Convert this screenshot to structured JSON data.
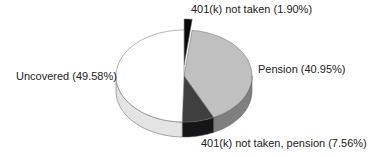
{
  "chart_data": {
    "type": "pie",
    "style": "3d-exploded",
    "title": "",
    "start_angle": -90,
    "direction": "clockwise",
    "slices": [
      {
        "label": "401(k) not taken",
        "value": 1.9,
        "display": "401(k) not taken (1.90%)",
        "top_color": "#0a0a0a",
        "side_color": "#000000",
        "explode": 11
      },
      {
        "label": "Pension",
        "value": 40.95,
        "display": "Pension (40.95%)",
        "top_color": "#c0c0c0",
        "side_color": "#7f7f7f",
        "explode": 0
      },
      {
        "label": "401(k) not taken, pension",
        "value": 7.56,
        "display": "401(k) not taken, pension (7.56%)",
        "top_color": "#3f3f3f",
        "side_color": "#161616",
        "explode": 0
      },
      {
        "label": "Uncovered",
        "value": 49.58,
        "display": "Uncovered (49.58%)",
        "top_color": "#ffffff",
        "side_color": "#e4e4e4",
        "explode": 0
      }
    ],
    "geometry": {
      "cx": 184,
      "cy": 76,
      "rx": 68,
      "ry": 46,
      "depth": 15
    },
    "legend": "none (data labels on slices)"
  },
  "labels": {
    "slice_0": "401(k) not taken (1.90%)",
    "slice_1": "Pension (40.95%)",
    "slice_2": "401(k) not taken, pension (7.56%)",
    "slice_3": "Uncovered (49.58%)"
  }
}
